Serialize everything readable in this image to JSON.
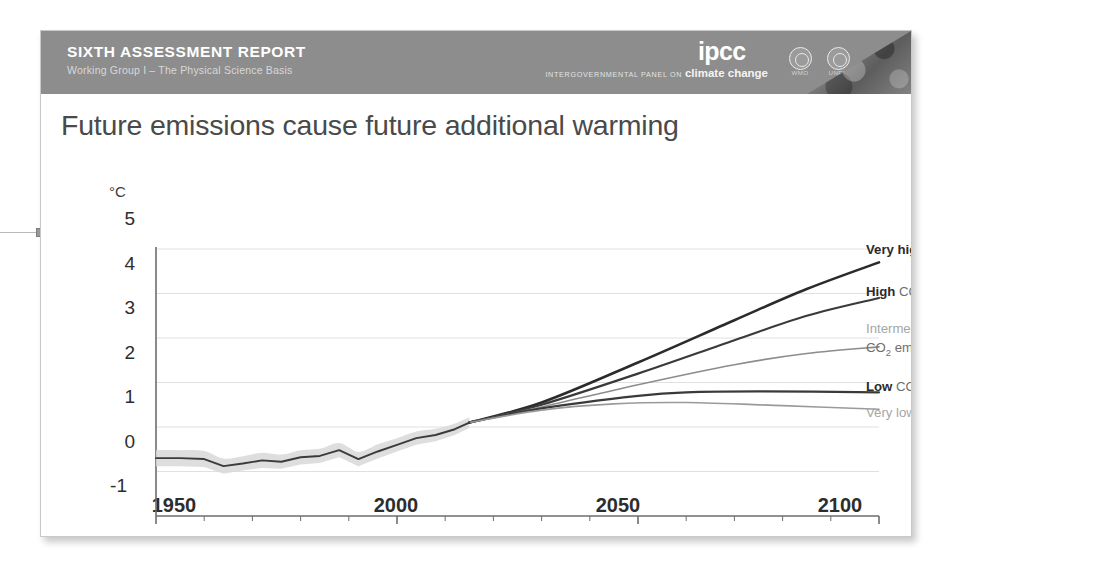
{
  "header": {
    "report_title": "SIXTH ASSESSMENT REPORT",
    "working_group": "Working Group I – The Physical Science Basis",
    "logo_mark": "ipcc",
    "logo_tagline_small": "INTERGOVERNMENTAL PANEL ON",
    "logo_tagline_large": "climate change",
    "badges": [
      {
        "name": "wmo-badge",
        "label": "WMO"
      },
      {
        "name": "unep-badge",
        "label": "UNEP"
      }
    ],
    "band_color": "#8d8d8d",
    "text_color": "#ffffff"
  },
  "slide": {
    "title": "Future emissions cause future additional warming",
    "title_color": "#4a4a4a",
    "background": "#ffffff"
  },
  "chart_data": {
    "type": "line",
    "title": "Future emissions cause future additional warming",
    "xlabel": "",
    "ylabel": "",
    "y_unit": "°C",
    "xlim": [
      1950,
      2100
    ],
    "ylim": [
      -1,
      5
    ],
    "yticks": [
      5,
      4,
      3,
      2,
      1,
      0,
      -1
    ],
    "xticks": [
      1950,
      2000,
      2050,
      2100
    ],
    "x_minor_tick_interval": 10,
    "grid": "horizontal",
    "legend_position": "right",
    "historical": {
      "name": "Observed warming",
      "color": "#3b3b3b",
      "band_color": "#d8d8d8",
      "x": [
        1950,
        1955,
        1960,
        1964,
        1968,
        1972,
        1976,
        1980,
        1984,
        1988,
        1992,
        1996,
        2000,
        2004,
        2008,
        2012,
        2015
      ],
      "values": [
        0.3,
        0.3,
        0.28,
        0.12,
        0.18,
        0.25,
        0.22,
        0.32,
        0.35,
        0.48,
        0.28,
        0.45,
        0.6,
        0.75,
        0.82,
        0.95,
        1.1
      ],
      "band_low": [
        0.12,
        0.12,
        0.1,
        -0.05,
        0.02,
        0.08,
        0.06,
        0.16,
        0.19,
        0.32,
        0.12,
        0.29,
        0.45,
        0.6,
        0.68,
        0.82,
        0.98
      ],
      "band_high": [
        0.48,
        0.48,
        0.46,
        0.29,
        0.34,
        0.42,
        0.38,
        0.48,
        0.51,
        0.64,
        0.44,
        0.61,
        0.75,
        0.9,
        0.96,
        1.08,
        1.22
      ]
    },
    "series": [
      {
        "name": "Very high CO2 emissions",
        "legend_bold": "Very high",
        "legend_rest": " CO₂ emissions",
        "color": "#2b2b2b",
        "width": 2.6,
        "x": [
          2015,
          2030,
          2050,
          2070,
          2085,
          2100
        ],
        "values": [
          1.1,
          1.55,
          2.45,
          3.4,
          4.1,
          4.7
        ]
      },
      {
        "name": "High CO2 emissions",
        "legend_bold": "High",
        "legend_rest": " CO₂ emissions",
        "color": "#3a3a3a",
        "width": 2.2,
        "x": [
          2015,
          2030,
          2050,
          2070,
          2085,
          2100
        ],
        "values": [
          1.1,
          1.5,
          2.2,
          2.95,
          3.5,
          3.9
        ]
      },
      {
        "name": "Intermediate CO2 emissions",
        "legend_bold": "Intermediate",
        "legend_rest": "CO₂ emissions",
        "color": "#8c8c8c",
        "width": 1.6,
        "x": [
          2015,
          2030,
          2050,
          2070,
          2085,
          2100
        ],
        "values": [
          1.1,
          1.45,
          1.95,
          2.4,
          2.65,
          2.8
        ]
      },
      {
        "name": "Low CO2 emissions",
        "legend_bold": "Low",
        "legend_rest": " CO₂ emissions",
        "color": "#3a3a3a",
        "width": 2.2,
        "x": [
          2015,
          2030,
          2050,
          2060,
          2075,
          2100
        ],
        "values": [
          1.1,
          1.42,
          1.7,
          1.78,
          1.8,
          1.78
        ]
      },
      {
        "name": "Very low CO2 emissions",
        "legend_bold": "Very low",
        "legend_rest": " CO₂ emissions",
        "color": "#9a9a9a",
        "width": 1.6,
        "x": [
          2015,
          2030,
          2045,
          2060,
          2080,
          2100
        ],
        "values": [
          1.1,
          1.38,
          1.52,
          1.55,
          1.48,
          1.4
        ]
      }
    ]
  },
  "legend": {
    "very_high_bold": "Very high",
    "very_high_rest": "emissions",
    "high_bold": "High",
    "high_rest": "emissions",
    "intermediate_bold": "Intermediate",
    "intermediate_rest": "emissions",
    "low_bold": "Low",
    "low_rest": "emissions",
    "very_low_bold": "Very low",
    "very_low_rest": "emissions"
  },
  "axis": {
    "unit": "°C",
    "y_labels": [
      "5",
      "4",
      "3",
      "2",
      "1",
      "0",
      "-1"
    ],
    "x_labels": [
      "1950",
      "2000",
      "2050",
      "2100"
    ]
  }
}
